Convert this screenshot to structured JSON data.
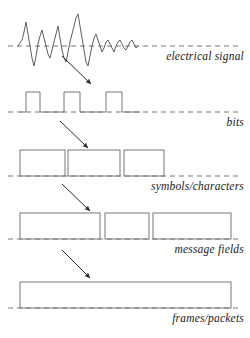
{
  "figure": {
    "background_color": "#ffffff",
    "stroke_color": "#555555",
    "text_color": "#1a1a1a",
    "width": 250,
    "height": 338
  },
  "tiers": [
    {
      "id": "electrical-signal",
      "label": "electrical signal",
      "kind": "analog-waveform",
      "baseline_y": 46,
      "label_position": "right"
    },
    {
      "id": "bits",
      "label": "bits",
      "kind": "square-wave",
      "baseline_y": 112,
      "label_position": "right"
    },
    {
      "id": "symbols-characters",
      "label": "symbols/characters",
      "kind": "rectangles",
      "baseline_y": 176,
      "label_position": "right"
    },
    {
      "id": "message-fields",
      "label": "message fields",
      "kind": "rectangles",
      "baseline_y": 239,
      "label_position": "right"
    },
    {
      "id": "frames-packets",
      "label": "frames/packets",
      "kind": "rectangles",
      "baseline_y": 308,
      "label_position": "right"
    }
  ],
  "baselines": [
    {
      "id": "baseline-electrical",
      "y": 46,
      "x1": 8,
      "x2": 242,
      "style": "dashed"
    },
    {
      "id": "baseline-bits",
      "y": 112,
      "x1": 8,
      "x2": 242,
      "style": "dashed"
    },
    {
      "id": "baseline-symbols",
      "y": 176,
      "x1": 8,
      "x2": 242,
      "style": "dashed"
    },
    {
      "id": "baseline-message",
      "y": 239,
      "x1": 8,
      "x2": 242,
      "style": "dashed"
    },
    {
      "id": "baseline-frames",
      "y": 308,
      "x1": 8,
      "x2": 242,
      "style": "dashed"
    }
  ],
  "waveform": {
    "id": "analog-waveform",
    "baseline_y": 46,
    "x_start": 18,
    "x_end": 138,
    "points": "18,46 20,43 22,40 24,32 26,22 28,34 30,46 32,58 34,66 36,56 38,44 40,36 42,30 44,38 46,46 48,54 50,58 52,50 54,42 56,34 58,26 60,38 62,50 64,58 66,62 68,52 70,42 72,34 74,26 76,18 78,14 80,26 82,38 84,50 86,62 88,66 90,56 92,46 94,38 96,34 98,40 100,46 102,52 104,48 106,42 108,40 110,44 112,48 114,52 116,46 118,42 120,40 122,44 124,48 126,50 128,46 130,42 132,40 134,44 136,48 138,46"
  },
  "square_wave": {
    "id": "digital-square-wave",
    "baseline_y": 112,
    "high_y": 92,
    "pulses": [
      {
        "x1": 26,
        "x2": 40
      },
      {
        "x1": 64,
        "x2": 80
      },
      {
        "x1": 106,
        "x2": 122
      }
    ],
    "trace": "20,112 26,112 26,92 40,92 40,112 64,112 64,92 80,92 80,112 106,112 106,92 122,92 122,112 140,112"
  },
  "rectangle_groups": [
    {
      "id": "symbols-rects",
      "tier": "symbols-characters",
      "y": 150,
      "height": 26,
      "rects": [
        {
          "x": 20,
          "width": 45
        },
        {
          "x": 68,
          "width": 52
        },
        {
          "x": 124,
          "width": 40
        }
      ]
    },
    {
      "id": "message-rects",
      "tier": "message-fields",
      "y": 213,
      "height": 26,
      "rects": [
        {
          "x": 20,
          "width": 80
        },
        {
          "x": 105,
          "width": 44
        },
        {
          "x": 153,
          "width": 78
        }
      ]
    },
    {
      "id": "frames-rects",
      "tier": "frames-packets",
      "y": 282,
      "height": 26,
      "rects": [
        {
          "x": 20,
          "width": 211
        }
      ]
    }
  ],
  "arrows": [
    {
      "id": "arrow-signal-to-bits",
      "x1": 62,
      "y1": 56,
      "x2": 93,
      "y2": 86,
      "head": "filled"
    },
    {
      "id": "arrow-bits-to-symbols",
      "x1": 60,
      "y1": 121,
      "x2": 90,
      "y2": 150,
      "head": "filled"
    },
    {
      "id": "arrow-symbols-to-message",
      "x1": 62,
      "y1": 184,
      "x2": 92,
      "y2": 213,
      "head": "filled"
    },
    {
      "id": "arrow-message-to-frames",
      "x1": 62,
      "y1": 250,
      "x2": 92,
      "y2": 280,
      "head": "filled"
    }
  ]
}
